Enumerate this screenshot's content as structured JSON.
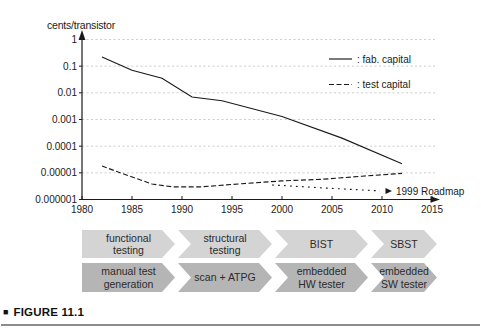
{
  "figure": {
    "marker": "■",
    "caption": "FIGURE 11.1"
  },
  "chart_data": {
    "type": "line",
    "title": "cents/transistor",
    "xlabel": "",
    "ylabel": "cents/transistor",
    "x_ticks": [
      1980,
      1985,
      1990,
      1995,
      2000,
      2005,
      2010,
      2015
    ],
    "y_ticks": [
      {
        "label": "1",
        "value": 1
      },
      {
        "label": "0.1",
        "value": 0.1
      },
      {
        "label": "0.01",
        "value": 0.01
      },
      {
        "label": "0.001",
        "value": 0.001
      },
      {
        "label": "0.0001",
        "value": 0.0001
      },
      {
        "label": "0.00001",
        "value": 1e-05
      },
      {
        "label": "0.000001",
        "value": 1e-06
      }
    ],
    "x_range": [
      1980,
      2016
    ],
    "y_range": [
      1e-06,
      1
    ],
    "y_scale": "log",
    "grid": "horizontal-dashed",
    "legend_position": "top-right",
    "legend": [
      {
        "style": "solid",
        "label": ": fab. capital"
      },
      {
        "style": "dashed",
        "label": ": test capital"
      }
    ],
    "series": [
      {
        "name": "fab. capital",
        "style": "solid",
        "points": [
          [
            1982,
            0.22
          ],
          [
            1985,
            0.07
          ],
          [
            1988,
            0.035
          ],
          [
            1991,
            0.007
          ],
          [
            1994,
            0.005
          ],
          [
            2000,
            0.0013
          ],
          [
            2006,
            0.0002
          ],
          [
            2012,
            2.2e-05
          ]
        ]
      },
      {
        "name": "test capital",
        "style": "dashed",
        "points": [
          [
            1982,
            1.8e-05
          ],
          [
            1984,
            9.5e-06
          ],
          [
            1987,
            3.8e-06
          ],
          [
            1989,
            3e-06
          ],
          [
            1992,
            3e-06
          ],
          [
            1996,
            3.9e-06
          ],
          [
            2000,
            5e-06
          ],
          [
            2004,
            5.7e-06
          ],
          [
            2008,
            7.5e-06
          ],
          [
            2012,
            9.5e-06
          ]
        ]
      },
      {
        "name": "1999 Roadmap",
        "style": "dotted",
        "points": [
          [
            1999,
            3.5e-06
          ],
          [
            2005,
            2.6e-06
          ],
          [
            2009.8,
            2.1e-06
          ]
        ]
      }
    ],
    "annotation": {
      "marker": "arrow-right",
      "label": "1999 Roadmap"
    },
    "colors": {
      "line": "#1a1a1a",
      "grid": "#c6c6c6"
    }
  },
  "timeline": {
    "rows": [
      {
        "name": "test-methods",
        "color": "#d4d4d4",
        "items": [
          "functional\ntesting",
          "structural\ntesting",
          "BIST",
          "SBST"
        ]
      },
      {
        "name": "test-tools",
        "color": "#b5b5b5",
        "items": [
          "manual test\ngeneration",
          "scan + ATPG",
          "embedded\nHW tester",
          "embedded\nSW tester"
        ]
      }
    ]
  }
}
